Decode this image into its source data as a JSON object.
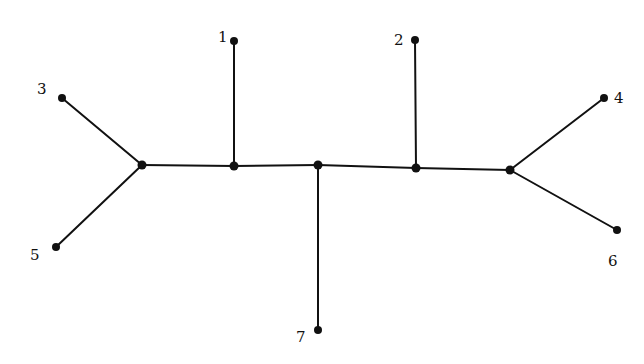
{
  "diagram": {
    "type": "unrooted phylogenetic tree",
    "colors": {
      "line": "#111111",
      "background": "#ffffff"
    },
    "internal_nodes": [
      {
        "id": "A",
        "x": 142,
        "y": 165
      },
      {
        "id": "B",
        "x": 234,
        "y": 166
      },
      {
        "id": "C",
        "x": 318,
        "y": 165
      },
      {
        "id": "D",
        "x": 416,
        "y": 168
      },
      {
        "id": "E",
        "x": 510,
        "y": 170
      }
    ],
    "leaves": [
      {
        "id": "1",
        "label": "1",
        "x": 234,
        "y": 41,
        "lx": 218,
        "ly": 42
      },
      {
        "id": "2",
        "label": "2",
        "x": 415,
        "y": 40,
        "lx": 394,
        "ly": 45
      },
      {
        "id": "3",
        "label": "3",
        "x": 62,
        "y": 98,
        "lx": 37,
        "ly": 94
      },
      {
        "id": "4",
        "label": "4",
        "x": 604,
        "y": 98,
        "lx": 614,
        "ly": 103
      },
      {
        "id": "5",
        "label": "5",
        "x": 56,
        "y": 247,
        "lx": 30,
        "ly": 260
      },
      {
        "id": "6",
        "label": "6",
        "x": 617,
        "y": 230,
        "lx": 608,
        "ly": 266
      },
      {
        "id": "7",
        "label": "7",
        "x": 318,
        "y": 330,
        "lx": 296,
        "ly": 342
      }
    ],
    "edges": [
      [
        "A",
        "B"
      ],
      [
        "B",
        "C"
      ],
      [
        "C",
        "D"
      ],
      [
        "D",
        "E"
      ],
      [
        "A",
        "3"
      ],
      [
        "A",
        "5"
      ],
      [
        "B",
        "1"
      ],
      [
        "C",
        "7"
      ],
      [
        "D",
        "2"
      ],
      [
        "E",
        "4"
      ],
      [
        "E",
        "6"
      ]
    ]
  }
}
